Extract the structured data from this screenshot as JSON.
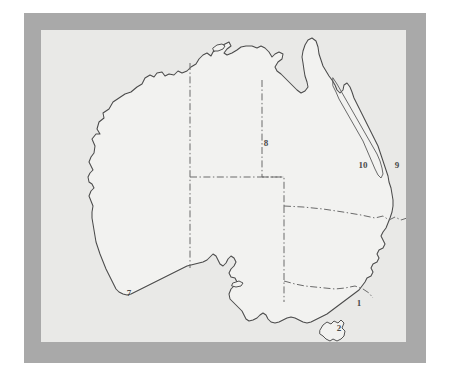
{
  "figure": {
    "outer_background": "#ffffff",
    "mat_color": "#a9a9a9",
    "panel_color": "#e9e9e7",
    "land_fill": "#f2f2f0",
    "coast_stroke": "#4a4a4a",
    "border_stroke": "#6a6a6a",
    "label_color": "#4a4a4a"
  },
  "map": {
    "name": "Australia",
    "landmass_name": "Australian mainland",
    "island_names": [
      "Tasmania",
      "Melville Island",
      "Kangaroo Island",
      "Fraser Island"
    ],
    "feature_names": [
      "Great Barrier Reef",
      "Cape York Peninsula",
      "Gulf of Carpentaria",
      "Great Australian Bight",
      "Spencer Gulf"
    ],
    "boundary_style": "dash-dot state borders"
  },
  "labels": [
    {
      "id": "label-1",
      "text": "1",
      "x": 318,
      "y": 273
    },
    {
      "id": "label-2",
      "text": "2",
      "x": 298,
      "y": 298
    },
    {
      "id": "label-7",
      "text": "7",
      "x": 88,
      "y": 263
    },
    {
      "id": "label-8",
      "text": "8",
      "x": 225,
      "y": 113
    },
    {
      "id": "label-9",
      "text": "9",
      "x": 356,
      "y": 135
    },
    {
      "id": "label-10",
      "text": "10",
      "x": 322,
      "y": 135
    },
    {
      "id": "label-11",
      "text": "11",
      "x": 385,
      "y": 184
    }
  ]
}
